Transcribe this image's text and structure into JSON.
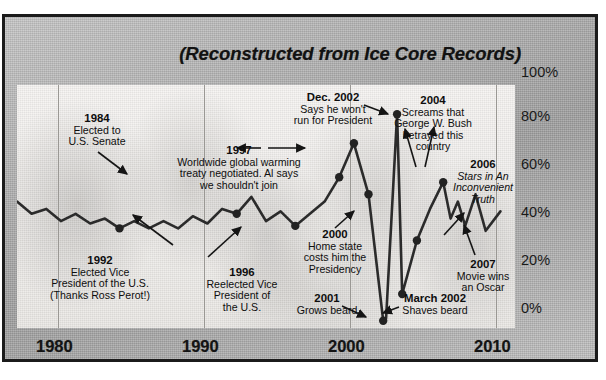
{
  "chart_title": "(Reconstructed from Ice Core Records)",
  "axes": {
    "x_ticks": [
      "1980",
      "1990",
      "2000",
      "2010"
    ],
    "y_ticks": [
      "100%",
      "80%",
      "60%",
      "40%",
      "20%",
      "0%"
    ]
  },
  "annotations": [
    {
      "id": "a1984",
      "year": "1984",
      "lines": [
        "Elected to",
        "U.S. Senate"
      ]
    },
    {
      "id": "a1992",
      "year": "1992",
      "lines": [
        "Elected Vice",
        "President of the U.S.",
        "(Thanks Ross Perot!)"
      ]
    },
    {
      "id": "a1996",
      "year": "1996",
      "lines": [
        "Reelected Vice",
        "President of",
        "the U.S."
      ]
    },
    {
      "id": "a1997",
      "year": "1997",
      "lines": [
        "Worldwide global warming",
        "treaty negotiated.  Al says",
        "we shouldn't join"
      ]
    },
    {
      "id": "a2000",
      "year": "2000",
      "lines": [
        "Home state",
        "costs him the",
        "Presidency"
      ]
    },
    {
      "id": "a2001",
      "year": "2001",
      "lines": [
        "Grows beard"
      ]
    },
    {
      "id": "adec2002",
      "year": "Dec. 2002",
      "lines": [
        "Says he won't",
        "run for President"
      ]
    },
    {
      "id": "amar2002",
      "year": "March 2002",
      "lines": [
        "Shaves beard"
      ]
    },
    {
      "id": "a2004",
      "year": "2004",
      "lines": [
        "Screams that",
        "George W. Bush",
        "betrayed this",
        "country"
      ]
    },
    {
      "id": "a2006",
      "year": "2006",
      "lines": [
        "Stars in An",
        "Inconvenient",
        "Truth"
      ]
    },
    {
      "id": "a2007",
      "year": "2007",
      "lines": [
        "Movie wins",
        "an Oscar"
      ]
    }
  ],
  "chart_data": {
    "type": "line",
    "title": "(Reconstructed from Ice Core Records)",
    "xlabel": "",
    "ylabel": "",
    "xlim": [
      1977,
      2011
    ],
    "ylim": [
      0,
      100
    ],
    "grid": true,
    "legend": "none",
    "x_tick_values": [
      1980,
      1990,
      2000,
      2010
    ],
    "y_tick_values": [
      0,
      20,
      40,
      60,
      80,
      100
    ],
    "y_tick_labels": [
      "0%",
      "20%",
      "40%",
      "60%",
      "80%",
      "100%"
    ],
    "series": [
      {
        "name": "Al Gore popularity",
        "x": [
          1977,
          1978,
          1979,
          1980,
          1981,
          1982,
          1983,
          1984,
          1985,
          1986,
          1987,
          1988,
          1989,
          1990,
          1991,
          1992,
          1993,
          1994,
          1995,
          1996,
          1997,
          1998,
          1999,
          2000,
          2001,
          2002.0,
          2002.2,
          2002.95,
          2003.3,
          2004.3,
          2005.2,
          2006.1,
          2006.6,
          2007.1,
          2007.6,
          2008.3,
          2009.0,
          2010.0
        ],
        "values": [
          52,
          47,
          49,
          44,
          47,
          43,
          45,
          41,
          44,
          41,
          44,
          41,
          46,
          43,
          49,
          47,
          54,
          44,
          48,
          42,
          47,
          52,
          62,
          76,
          55,
          3,
          4,
          88,
          14,
          36,
          49,
          60,
          45,
          52,
          42,
          55,
          40,
          48
        ],
        "color": "#2b2b2b"
      }
    ],
    "markers": [
      {
        "label": "1984",
        "x": 1984,
        "y": 41
      },
      {
        "label": "1992",
        "x": 1992,
        "y": 47
      },
      {
        "label": "1996",
        "x": 1996,
        "y": 42
      },
      {
        "label": "1997",
        "x": 1999,
        "y": 62
      },
      {
        "label": "2000",
        "x": 2000,
        "y": 76
      },
      {
        "label": "2001",
        "x": 2001,
        "y": 55
      },
      {
        "label": "March 2002",
        "x": 2002,
        "y": 3
      },
      {
        "label": "Dec. 2002",
        "x": 2002.95,
        "y": 88
      },
      {
        "label": "2004",
        "x": 2003.3,
        "y": 14
      },
      {
        "label": "2006",
        "x": 2004.3,
        "y": 36
      },
      {
        "label": "2007",
        "x": 2006.1,
        "y": 60
      }
    ],
    "annotation_texts": [
      "1984 Elected to U.S. Senate",
      "1992 Elected Vice President of the U.S. (Thanks Ross Perot!)",
      "1996 Reelected Vice President of the U.S.",
      "1997 Worldwide global warming treaty negotiated.  Al says we shouldn't join",
      "2000 Home state costs him the Presidency",
      "2001 Grows beard",
      "Dec. 2002 Says he won't run for President",
      "March 2002 Shaves beard",
      "2004 Screams that George W. Bush betrayed this country",
      "2006 Stars in An Inconvenient Truth",
      "2007 Movie wins an Oscar"
    ]
  },
  "colors": {
    "frame_border": "#1b1b1b",
    "frame_fill": "#aeaeae",
    "plot_fill": "#f2f0ee",
    "line": "#2b2b2b",
    "gridline": "#9a9894",
    "text": "#0e0e0e"
  }
}
